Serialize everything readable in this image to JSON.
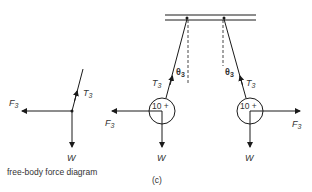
{
  "figure": {
    "label": "(c)",
    "caption": "free-body force diagram",
    "line_color": "#1a1a1a",
    "text_color": "#333333"
  },
  "free_body": {
    "tension": {
      "symbol": "T",
      "subscript": "3"
    },
    "force": {
      "symbol": "F",
      "subscript": "3"
    },
    "weight": {
      "symbol": "W"
    }
  },
  "left_pendulum": {
    "mass_label": "10 +",
    "angle": {
      "symbol": "θ",
      "subscript": "3"
    },
    "tension": {
      "symbol": "T",
      "subscript": "3"
    },
    "force": {
      "symbol": "F",
      "subscript": "3"
    },
    "weight": {
      "symbol": "W"
    }
  },
  "right_pendulum": {
    "mass_label": "10 +",
    "angle": {
      "symbol": "θ",
      "subscript": "3"
    },
    "tension": {
      "symbol": "T",
      "subscript": "3"
    },
    "force": {
      "symbol": "F",
      "subscript": "3"
    },
    "weight": {
      "symbol": "W"
    }
  }
}
